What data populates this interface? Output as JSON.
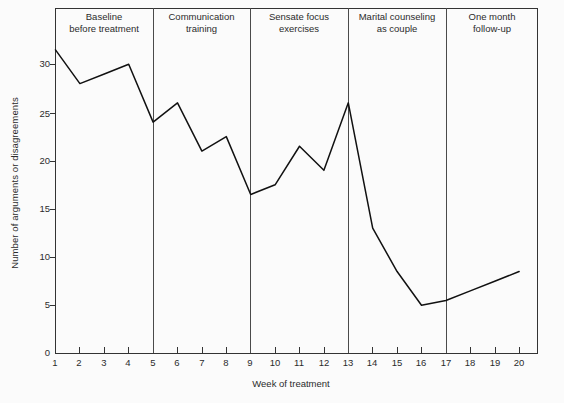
{
  "chart_data": {
    "type": "line",
    "title": "",
    "xlabel": "Week of treatment",
    "ylabel": "Number of arguments or disagreements",
    "xlim": [
      1,
      20
    ],
    "ylim": [
      0,
      32
    ],
    "grid": false,
    "legend": "none",
    "x": [
      1,
      2,
      3,
      4,
      5,
      6,
      7,
      8,
      9,
      10,
      11,
      12,
      13,
      14,
      15,
      16,
      17,
      18,
      19,
      20
    ],
    "values": [
      31.5,
      28,
      29,
      30,
      24,
      26,
      21,
      22.5,
      16.5,
      17.5,
      21.5,
      19,
      26,
      13,
      8.5,
      5,
      5.5,
      6.5,
      7.5,
      8.5
    ],
    "series": [
      {
        "name": "Number of arguments or disagreements",
        "values": [
          31.5,
          28,
          29,
          30,
          24,
          26,
          21,
          22.5,
          16.5,
          17.5,
          21.5,
          19,
          26,
          13,
          8.5,
          5,
          5.5,
          6.5,
          7.5,
          8.5
        ]
      }
    ],
    "y_ticks": [
      0,
      5,
      10,
      15,
      20,
      25,
      30
    ],
    "y_tick_labels": [
      "0",
      "5",
      "10",
      "15",
      "20",
      "25",
      "30"
    ],
    "x_ticks": [
      1,
      2,
      3,
      4,
      5,
      6,
      7,
      8,
      9,
      10,
      11,
      12,
      13,
      14,
      15,
      16,
      17,
      18,
      19,
      20
    ],
    "x_tick_labels": [
      "1",
      "2",
      "3",
      "4",
      "5",
      "6",
      "7",
      "8",
      "9",
      "10",
      "11",
      "12",
      "13",
      "14",
      "15",
      "16",
      "17",
      "18",
      "19",
      "20"
    ],
    "line_color": "#111111",
    "axis_color": "#333333",
    "phase_divider_weeks": [
      5,
      9,
      13,
      17
    ],
    "phases": [
      {
        "line1": "Baseline",
        "line2": "before treatment",
        "start_week": 1,
        "end_week": 5
      },
      {
        "line1": "Communication",
        "line2": "training",
        "start_week": 5,
        "end_week": 9
      },
      {
        "line1": "Sensate focus",
        "line2": "exercises",
        "start_week": 9,
        "end_week": 13
      },
      {
        "line1": "Marital counseling",
        "line2": "as couple",
        "start_week": 13,
        "end_week": 17
      },
      {
        "line1": "One month",
        "line2": "follow-up",
        "start_week": 17,
        "end_week": 20.6
      }
    ]
  }
}
